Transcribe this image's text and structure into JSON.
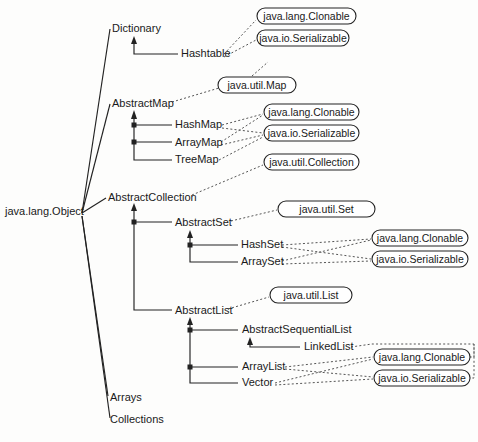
{
  "diagram": {
    "root": {
      "label": "java.lang.Object",
      "x": 5,
      "y": 215
    },
    "classes": [
      {
        "id": "dictionary",
        "label": "Dictionary",
        "x": 112,
        "y": 32,
        "anchor": "start"
      },
      {
        "id": "hashtable",
        "label": "Hashtable",
        "x": 181,
        "y": 57,
        "anchor": "start"
      },
      {
        "id": "abstractmap",
        "label": "AbstractMap",
        "x": 112,
        "y": 107,
        "anchor": "start"
      },
      {
        "id": "hashmap",
        "label": "HashMap",
        "x": 175,
        "y": 128,
        "anchor": "start"
      },
      {
        "id": "arraymap",
        "label": "ArrayMap",
        "x": 175,
        "y": 146,
        "anchor": "start"
      },
      {
        "id": "treemap",
        "label": "TreeMap",
        "x": 175,
        "y": 163,
        "anchor": "start"
      },
      {
        "id": "abstractcollection",
        "label": "AbstractCollection",
        "x": 108,
        "y": 201,
        "anchor": "start"
      },
      {
        "id": "abstractset",
        "label": "AbstractSet",
        "x": 175,
        "y": 226,
        "anchor": "start"
      },
      {
        "id": "hashset",
        "label": "HashSet",
        "x": 241,
        "y": 248,
        "anchor": "start"
      },
      {
        "id": "arrayset",
        "label": "ArraySet",
        "x": 241,
        "y": 265,
        "anchor": "start"
      },
      {
        "id": "abstractlist",
        "label": "AbstractList",
        "x": 175,
        "y": 314,
        "anchor": "start"
      },
      {
        "id": "abstractsequentiallist",
        "label": "AbstractSequentialList",
        "x": 242,
        "y": 333,
        "anchor": "start"
      },
      {
        "id": "linkedlist",
        "label": "LinkedList",
        "x": 304,
        "y": 350,
        "anchor": "start"
      },
      {
        "id": "arraylist",
        "label": "ArrayList",
        "x": 242,
        "y": 370,
        "anchor": "start"
      },
      {
        "id": "vector",
        "label": "Vector",
        "x": 242,
        "y": 386,
        "anchor": "start"
      },
      {
        "id": "arrays",
        "label": "Arrays",
        "x": 110,
        "y": 401,
        "anchor": "start"
      },
      {
        "id": "collections",
        "label": "Collections",
        "x": 110,
        "y": 423,
        "anchor": "start"
      }
    ],
    "interfaces": [
      {
        "id": "iface-clonable-1",
        "label": "java.lang.Clonable",
        "x": 257,
        "y": 8,
        "w": 99,
        "h": 16
      },
      {
        "id": "iface-serializable-1",
        "label": "java.io.Serializable",
        "x": 257,
        "y": 30,
        "w": 92,
        "h": 16
      },
      {
        "id": "iface-map",
        "label": "java.util.Map",
        "x": 218,
        "y": 77,
        "w": 78,
        "h": 16
      },
      {
        "id": "iface-clonable-2",
        "label": "java.lang.Clonable",
        "x": 264,
        "y": 104,
        "w": 95,
        "h": 16
      },
      {
        "id": "iface-serializable-2",
        "label": "java.io.Serializable",
        "x": 264,
        "y": 125,
        "w": 95,
        "h": 16
      },
      {
        "id": "iface-collection",
        "label": "java.util.Collection",
        "x": 264,
        "y": 154,
        "w": 95,
        "h": 16
      },
      {
        "id": "iface-set",
        "label": "java.util.Set",
        "x": 278,
        "y": 201,
        "w": 97,
        "h": 16
      },
      {
        "id": "iface-clonable-3",
        "label": "java.lang.Clonable",
        "x": 372,
        "y": 230,
        "w": 96,
        "h": 16
      },
      {
        "id": "iface-serializable-3",
        "label": "java.io.Serializable",
        "x": 372,
        "y": 251,
        "w": 96,
        "h": 16
      },
      {
        "id": "iface-list",
        "label": "java.util.List",
        "x": 270,
        "y": 287,
        "w": 82,
        "h": 16
      },
      {
        "id": "iface-clonable-4",
        "label": "java.lang.Clonable",
        "x": 374,
        "y": 349,
        "w": 96,
        "h": 16
      },
      {
        "id": "iface-serializable-4",
        "label": "java.io.Serializable",
        "x": 374,
        "y": 370,
        "w": 96,
        "h": 16
      }
    ],
    "inheritance_edges": [
      {
        "from": "java.lang.Object",
        "to": "Dictionary"
      },
      {
        "from": "java.lang.Object",
        "to": "AbstractMap"
      },
      {
        "from": "java.lang.Object",
        "to": "AbstractCollection"
      },
      {
        "from": "java.lang.Object",
        "to": "Arrays"
      },
      {
        "from": "java.lang.Object",
        "to": "Collections"
      },
      {
        "from": "Dictionary",
        "to": "Hashtable"
      },
      {
        "from": "AbstractMap",
        "to": "HashMap"
      },
      {
        "from": "AbstractMap",
        "to": "ArrayMap"
      },
      {
        "from": "AbstractMap",
        "to": "TreeMap"
      },
      {
        "from": "AbstractCollection",
        "to": "AbstractSet"
      },
      {
        "from": "AbstractCollection",
        "to": "AbstractList"
      },
      {
        "from": "AbstractSet",
        "to": "HashSet"
      },
      {
        "from": "AbstractSet",
        "to": "ArraySet"
      },
      {
        "from": "AbstractList",
        "to": "AbstractSequentialList"
      },
      {
        "from": "AbstractList",
        "to": "ArrayList"
      },
      {
        "from": "AbstractList",
        "to": "Vector"
      },
      {
        "from": "AbstractSequentialList",
        "to": "LinkedList"
      }
    ],
    "implements_edges": [
      {
        "from": "Hashtable",
        "to": "java.lang.Clonable"
      },
      {
        "from": "Hashtable",
        "to": "java.io.Serializable"
      },
      {
        "from": "AbstractMap",
        "to": "java.util.Map"
      },
      {
        "from": "HashMap",
        "to": "java.lang.Clonable"
      },
      {
        "from": "HashMap",
        "to": "java.io.Serializable"
      },
      {
        "from": "ArrayMap",
        "to": "java.lang.Clonable"
      },
      {
        "from": "ArrayMap",
        "to": "java.io.Serializable"
      },
      {
        "from": "TreeMap",
        "to": "java.lang.Clonable"
      },
      {
        "from": "AbstractCollection",
        "to": "java.util.Collection"
      },
      {
        "from": "AbstractSet",
        "to": "java.util.Set"
      },
      {
        "from": "HashSet",
        "to": "java.lang.Clonable"
      },
      {
        "from": "HashSet",
        "to": "java.io.Serializable"
      },
      {
        "from": "ArraySet",
        "to": "java.lang.Clonable"
      },
      {
        "from": "ArraySet",
        "to": "java.io.Serializable"
      },
      {
        "from": "AbstractList",
        "to": "java.util.List"
      },
      {
        "from": "LinkedList",
        "to": "java.lang.Clonable"
      },
      {
        "from": "LinkedList",
        "to": "java.io.Serializable"
      },
      {
        "from": "ArrayList",
        "to": "java.lang.Clonable"
      },
      {
        "from": "ArrayList",
        "to": "java.io.Serializable"
      },
      {
        "from": "Vector",
        "to": "java.lang.Clonable"
      },
      {
        "from": "Vector",
        "to": "java.io.Serializable"
      }
    ],
    "colors": {
      "background": "#fdfdfc",
      "text": "#1a1a1a",
      "solid_line": "#222222",
      "dotted_line": "#555555",
      "box_fill": "#ffffff"
    }
  }
}
